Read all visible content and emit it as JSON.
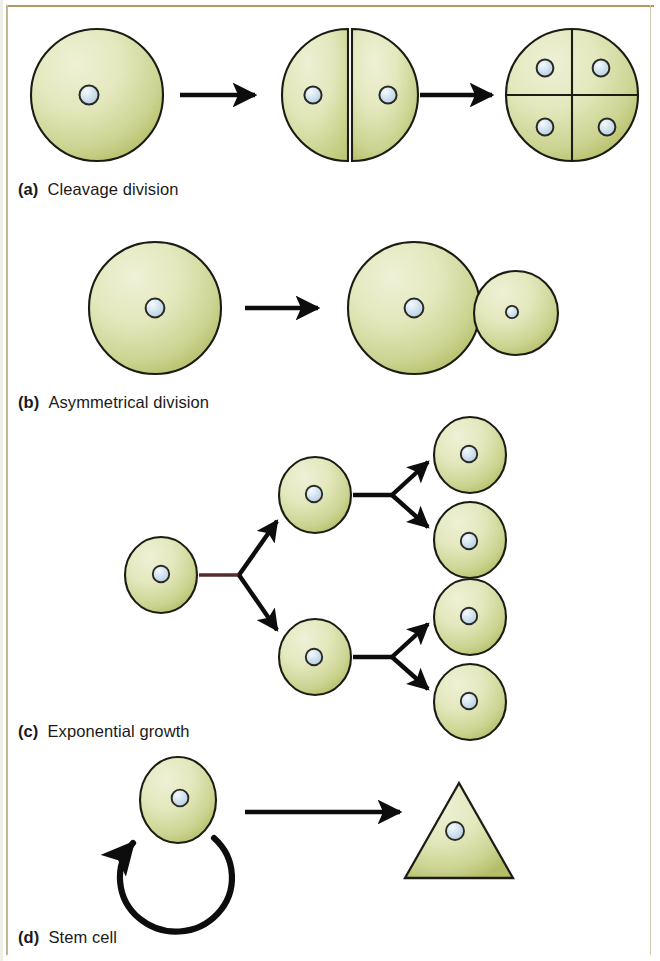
{
  "figure": {
    "background_color": "#ffffff",
    "frame_color": "#b09a62"
  },
  "style": {
    "cell_fill_light": "#e8ecc4",
    "cell_fill_mid": "#dde2ab",
    "cell_fill_dark": "#b6c068",
    "cell_stroke": "#1c1c14",
    "nucleus_fill": "#cfe0ee",
    "nucleus_highlight": "#f2f8fc",
    "nucleus_stroke": "#2a2a24",
    "arrow_color": "#0d0d0d",
    "stem_connector_color": "#5a2a2a"
  },
  "panels": [
    {
      "id": "cleavage",
      "letter": "(a)",
      "label": "Cleavage division",
      "caption_x": 18,
      "caption_y": 180,
      "stages": [
        {
          "name": "one-cell-zygote",
          "cells": 1,
          "nuclei": 1
        },
        {
          "name": "two-cell-stage",
          "cells": 2,
          "nuclei": 2
        },
        {
          "name": "four-cell-stage",
          "cells": 4,
          "nuclei": 4
        }
      ],
      "arrows": 2
    },
    {
      "id": "asymmetrical",
      "letter": "(b)",
      "label": "Asymmetrical division",
      "caption_x": 18,
      "caption_y": 393,
      "stages": [
        {
          "name": "parent-cell",
          "cells": 1,
          "nuclei": 1
        },
        {
          "name": "large-daughter-and-small-daughter",
          "cells": 2,
          "nuclei": 2
        }
      ],
      "arrows": 1
    },
    {
      "id": "exponential",
      "letter": "(c)",
      "label": "Exponential growth",
      "caption_x": 18,
      "caption_y": 722,
      "generations": [
        {
          "name": "generation-1",
          "count": 1
        },
        {
          "name": "generation-2",
          "count": 2
        },
        {
          "name": "generation-4",
          "count": 4
        }
      ],
      "arrows": 6
    },
    {
      "id": "stem-cell",
      "letter": "(d)",
      "label": "Stem cell",
      "caption_x": 18,
      "caption_y": 928,
      "stages": [
        {
          "name": "stem-cell",
          "shape": "circle"
        },
        {
          "name": "differentiated-cell",
          "shape": "triangle"
        }
      ],
      "self_renewal_loop": true,
      "arrows": 1
    }
  ]
}
